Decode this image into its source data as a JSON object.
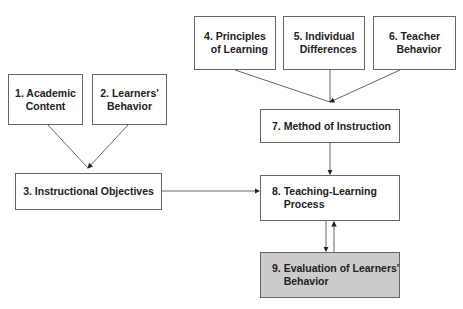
{
  "nodes": [
    {
      "id": 1,
      "label": "1. Academic\nContent"
    },
    {
      "id": 2,
      "label": "2. Learners'\nBehavior"
    },
    {
      "id": 3,
      "label": "3. Instructional Objectives"
    },
    {
      "id": 4,
      "label": "4. Principles\n   of Learning"
    },
    {
      "id": 5,
      "label": "5. Individual\n   Differences"
    },
    {
      "id": 6,
      "label": "6. Teacher\n   Behavior"
    },
    {
      "id": 7,
      "label": "7. Method of Instruction"
    },
    {
      "id": 8,
      "label": "8. Teaching-Learning\n    Process"
    },
    {
      "id": 9,
      "label": "9. Evaluation of Learners'\n    Behavior"
    }
  ],
  "edges": [
    {
      "from": 1,
      "to": 3
    },
    {
      "from": 2,
      "to": 3
    },
    {
      "from": 4,
      "to": 7
    },
    {
      "from": 5,
      "to": 7
    },
    {
      "from": 6,
      "to": 7
    },
    {
      "from": 3,
      "to": 8
    },
    {
      "from": 7,
      "to": 8
    },
    {
      "from": 8,
      "to": 9
    },
    {
      "from": 9,
      "to": 8
    }
  ],
  "colors": {
    "line": "#555555",
    "box_border": "#666666",
    "highlight_fill": "#cbcbcb"
  }
}
